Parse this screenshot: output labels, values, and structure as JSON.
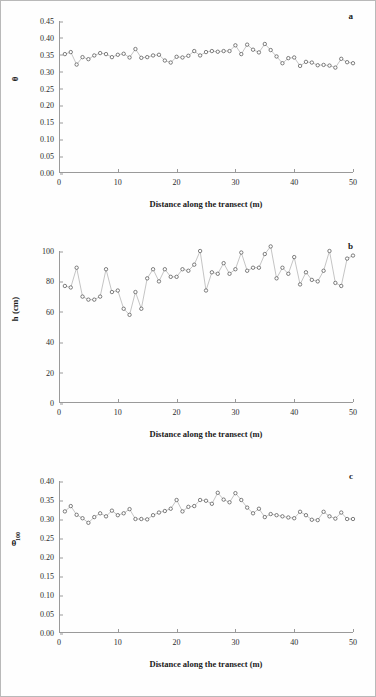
{
  "figure": {
    "xlabel": "Distance along the transect (m)",
    "panel_letters": {
      "a": "a",
      "b": "b",
      "c": "c"
    },
    "marker_color": "#4a4a4a",
    "line_color": "#8a8a8a",
    "axis_color": "#9a9a9a"
  },
  "chart_data": [
    {
      "type": "scatter",
      "panel": "a",
      "title": "",
      "xlabel": "Distance along the transect (m)",
      "ylabel": "θ",
      "xlim": [
        0,
        50
      ],
      "ylim": [
        0.0,
        0.45
      ],
      "xticks": [
        0,
        10,
        20,
        30,
        40,
        50
      ],
      "yticks": [
        0.0,
        0.05,
        0.1,
        0.15,
        0.2,
        0.25,
        0.3,
        0.35,
        0.4,
        0.45
      ],
      "ytick_labels": [
        "0.00",
        "0.05",
        "0.10",
        "0.15",
        "0.20",
        "0.25",
        "0.30",
        "0.35",
        "0.40",
        "0.45"
      ],
      "xtick_labels": [
        "0",
        "10",
        "20",
        "30",
        "40",
        "50"
      ],
      "grid": false,
      "legend": "none",
      "x": [
        1,
        2,
        3,
        4,
        5,
        6,
        7,
        8,
        9,
        10,
        11,
        12,
        13,
        14,
        15,
        16,
        17,
        18,
        19,
        20,
        21,
        22,
        23,
        24,
        25,
        26,
        27,
        28,
        29,
        30,
        31,
        32,
        33,
        34,
        35,
        36,
        37,
        38,
        39,
        40,
        41,
        42,
        43,
        44,
        45,
        46,
        47,
        48,
        49,
        50
      ],
      "values": [
        0.352,
        0.358,
        0.321,
        0.343,
        0.337,
        0.348,
        0.355,
        0.352,
        0.343,
        0.35,
        0.353,
        0.342,
        0.367,
        0.341,
        0.343,
        0.348,
        0.35,
        0.333,
        0.327,
        0.344,
        0.342,
        0.347,
        0.361,
        0.348,
        0.358,
        0.361,
        0.359,
        0.361,
        0.361,
        0.378,
        0.352,
        0.38,
        0.365,
        0.357,
        0.382,
        0.364,
        0.345,
        0.325,
        0.34,
        0.342,
        0.317,
        0.329,
        0.327,
        0.319,
        0.32,
        0.318,
        0.312,
        0.338,
        0.328,
        0.325
      ]
    },
    {
      "type": "scatter",
      "panel": "b",
      "title": "",
      "xlabel": "Distance along the transect (m)",
      "ylabel": "h (cm)",
      "xlim": [
        0,
        50
      ],
      "ylim": [
        0,
        100
      ],
      "xticks": [
        0,
        10,
        20,
        30,
        40,
        50
      ],
      "yticks": [
        0,
        20,
        40,
        60,
        80,
        100
      ],
      "ytick_labels": [
        "0",
        "20",
        "40",
        "60",
        "80",
        "100"
      ],
      "xtick_labels": [
        "0",
        "10",
        "20",
        "30",
        "40",
        "50"
      ],
      "grid": false,
      "legend": "none",
      "x": [
        1,
        2,
        3,
        4,
        5,
        6,
        7,
        8,
        9,
        10,
        11,
        12,
        13,
        14,
        15,
        16,
        17,
        18,
        19,
        20,
        21,
        22,
        23,
        24,
        25,
        26,
        27,
        28,
        29,
        30,
        31,
        32,
        33,
        34,
        35,
        36,
        37,
        38,
        39,
        40,
        41,
        42,
        43,
        44,
        45,
        46,
        47,
        48,
        49,
        50
      ],
      "values": [
        77,
        76,
        89,
        70,
        68,
        68,
        70,
        88,
        73,
        74,
        62,
        58,
        73,
        62,
        82,
        88,
        80,
        88,
        83,
        83,
        88,
        87,
        91,
        100,
        74,
        86,
        85,
        92,
        85,
        88,
        99,
        87,
        89,
        89,
        98,
        103,
        82,
        89,
        85,
        96,
        78,
        86,
        81,
        80,
        87,
        100,
        79,
        77,
        95,
        97
      ]
    },
    {
      "type": "scatter",
      "panel": "c",
      "title": "",
      "xlabel": "Distance along the transect (m)",
      "ylabel": "θ100",
      "ylabel_base": "θ",
      "ylabel_sub": "100",
      "xlim": [
        0,
        50
      ],
      "ylim": [
        0.0,
        0.4
      ],
      "xticks": [
        0,
        10,
        20,
        30,
        40,
        50
      ],
      "yticks": [
        0.0,
        0.05,
        0.1,
        0.15,
        0.2,
        0.25,
        0.3,
        0.35,
        0.4
      ],
      "ytick_labels": [
        "0.00",
        "0.05",
        "0.10",
        "0.15",
        "0.20",
        "0.25",
        "0.30",
        "0.35",
        "0.40"
      ],
      "xtick_labels": [
        "0",
        "10",
        "20",
        "30",
        "40",
        "50"
      ],
      "grid": false,
      "legend": "none",
      "x": [
        1,
        2,
        3,
        4,
        5,
        6,
        7,
        8,
        9,
        10,
        11,
        12,
        13,
        14,
        15,
        16,
        17,
        18,
        19,
        20,
        21,
        22,
        23,
        24,
        25,
        26,
        27,
        28,
        29,
        30,
        31,
        32,
        33,
        34,
        35,
        36,
        37,
        38,
        39,
        40,
        41,
        42,
        43,
        44,
        45,
        46,
        47,
        48,
        49,
        50
      ],
      "values": [
        0.32,
        0.334,
        0.311,
        0.302,
        0.29,
        0.305,
        0.315,
        0.307,
        0.322,
        0.31,
        0.315,
        0.326,
        0.3,
        0.3,
        0.299,
        0.31,
        0.317,
        0.321,
        0.327,
        0.35,
        0.32,
        0.332,
        0.334,
        0.35,
        0.348,
        0.34,
        0.369,
        0.351,
        0.344,
        0.368,
        0.35,
        0.33,
        0.315,
        0.327,
        0.305,
        0.313,
        0.31,
        0.307,
        0.304,
        0.302,
        0.319,
        0.31,
        0.298,
        0.297,
        0.319,
        0.307,
        0.301,
        0.317,
        0.3,
        0.3
      ]
    }
  ]
}
